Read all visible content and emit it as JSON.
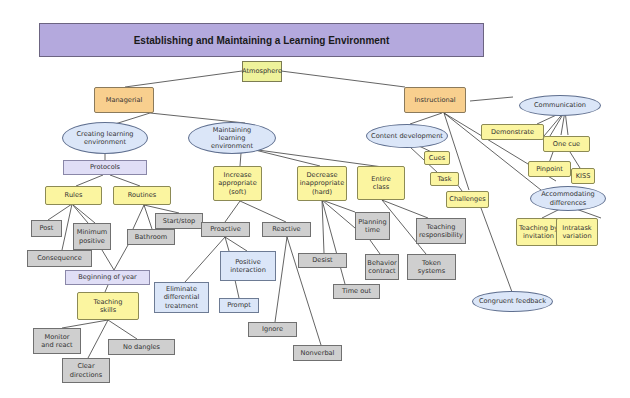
{
  "title": "Establishing and Maintaining a Learning Environment",
  "colors": {
    "title_bg": "#b4a9dd",
    "root": "#eef29b",
    "category": "#f8cf8e",
    "ellipse": "#dbe6f8",
    "yellow": "#fbf5a0",
    "lavender": "#e0def6",
    "blue_box": "#dbe6f8",
    "grey_box": "#cfcfcf",
    "line": "#3c3c3c"
  },
  "nodes": {
    "atmosphere": "Atmosphere",
    "managerial": "Managerial",
    "instructional": "Instructional",
    "creating": "Creating learning environment",
    "maintaining": "Maintaining learning environment",
    "protocols": "Protocols",
    "rules": "Rules",
    "routines": "Routines",
    "post": "Post",
    "minimum_positive": "Minimum positive",
    "consequence": "Consequence",
    "bathroom": "Bathroom",
    "start_stop": "Start/stop",
    "beginning_of_year": "Beginning of year",
    "teaching_skills": "Teaching skills",
    "monitor_react": "Monitor and react",
    "clear_directions": "Clear directions",
    "no_dangles": "No dangles",
    "increase_appropriate": "Increase appropriate (soft)",
    "decrease_inappropriate": "Decrease inappropriate (hard)",
    "entire_class": "Entire class",
    "proactive": "Proactive",
    "reactive": "Reactive",
    "positive_interaction": "Positive interaction",
    "eliminate_differential": "Eliminate differential treatment",
    "prompt": "Prompt",
    "ignore": "Ignore",
    "nonverbal": "Nonverbal",
    "desist": "Desist",
    "time_out": "Time out",
    "planning_time": "Planning time",
    "behavior_contract": "Behavior contract",
    "teaching_responsibility": "Teaching responsibility",
    "token_systems": "Token systems",
    "content_development": "Content development",
    "cues": "Cues",
    "task": "Task",
    "challenges": "Challenges",
    "communication": "Communication",
    "demonstrate": "Demonstrate",
    "one_cue": "One cue",
    "pinpoint": "Pinpoint",
    "kiss": "KISS",
    "accommodating": "Accommodating differences",
    "teaching_by_invitation": "Teaching by invitation",
    "intratask_variation": "Intratask variation",
    "congruent_feedback": "Congruent feedback"
  }
}
